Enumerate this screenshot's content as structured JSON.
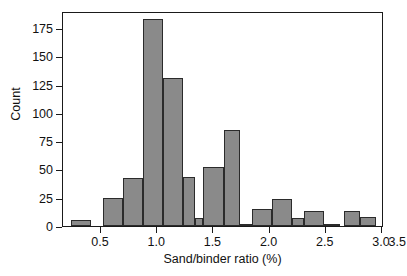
{
  "chart_data": {
    "type": "bar",
    "title": "",
    "subtitle": "",
    "xlabel": "Sand/binder ratio (%)",
    "ylabel": "Count",
    "xlim": [
      0.3,
      3.5
    ],
    "ylim": [
      0,
      190
    ],
    "grid": false,
    "legend": null,
    "bin_width": 0.2,
    "xticks": [
      0.5,
      1.0,
      1.5,
      2.0,
      2.5,
      3.0,
      3.5
    ],
    "xticklabels": [
      "0.5",
      "1.0",
      "1.5",
      "2.0",
      "2.5",
      "3.0",
      "3.5"
    ],
    "yticks": [
      0,
      25,
      50,
      75,
      100,
      125,
      150,
      175
    ],
    "yticklabels": [
      "0",
      "25",
      "50",
      "75",
      "100",
      "125",
      "150",
      "175"
    ],
    "bin_edges": [
      0.38,
      0.58,
      0.7,
      0.9,
      1.1,
      1.3,
      1.5,
      1.7,
      1.9,
      2.1,
      2.3,
      2.5,
      2.7,
      2.9,
      3.1,
      3.3
    ],
    "bins": [
      {
        "x0": 0.38,
        "x1": 0.58,
        "count": 5
      },
      {
        "x0": 0.7,
        "x1": 0.9,
        "count": 25
      },
      {
        "x0": 0.9,
        "x1": 1.1,
        "count": 42
      },
      {
        "x0": 1.1,
        "x1": 1.3,
        "count": 183
      },
      {
        "x0": 1.3,
        "x1": 1.5,
        "count": 131
      },
      {
        "x0": 1.5,
        "x1": 1.62,
        "count": 43
      },
      {
        "x0": 1.62,
        "x1": 1.7,
        "count": 7
      },
      {
        "x0": 1.7,
        "x1": 1.9,
        "count": 52
      },
      {
        "x0": 1.9,
        "x1": 2.06,
        "count": 85
      },
      {
        "x0": 2.06,
        "x1": 2.18,
        "count": 1
      },
      {
        "x0": 2.18,
        "x1": 2.38,
        "count": 15
      },
      {
        "x0": 2.38,
        "x1": 2.58,
        "count": 24
      },
      {
        "x0": 2.58,
        "x1": 2.7,
        "count": 7
      },
      {
        "x0": 2.7,
        "x1": 2.9,
        "count": 13
      },
      {
        "x0": 2.9,
        "x1": 3.06,
        "count": 1
      },
      {
        "x0": 3.1,
        "x1": 3.26,
        "count": 13
      },
      {
        "x0": 3.26,
        "x1": 3.42,
        "count": 8
      }
    ],
    "categories": [
      "0.48",
      "0.80",
      "1.00",
      "1.20",
      "1.40",
      "1.56",
      "1.66",
      "1.80",
      "1.98",
      "2.12",
      "2.28",
      "2.48",
      "2.64",
      "2.80",
      "2.98",
      "3.18",
      "3.34"
    ],
    "values": [
      5,
      25,
      42,
      183,
      131,
      43,
      7,
      52,
      85,
      1,
      15,
      24,
      7,
      13,
      1,
      13,
      8
    ],
    "colors": {
      "bar_fill": "#8a8a8a",
      "bar_edge": "#2b2b2b",
      "axis": "#1a1a1a",
      "text": "#111111",
      "background": "#ffffff"
    }
  }
}
